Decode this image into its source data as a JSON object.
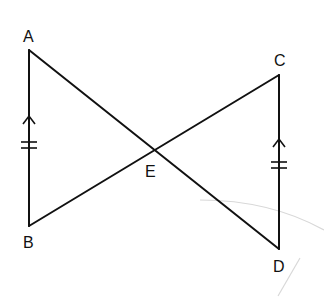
{
  "figure": {
    "type": "geometry",
    "points": {
      "A": {
        "label": "A",
        "x": 29,
        "y": 50
      },
      "B": {
        "label": "B",
        "x": 29,
        "y": 226
      },
      "C": {
        "label": "C",
        "x": 279,
        "y": 75
      },
      "D": {
        "label": "D",
        "x": 279,
        "y": 249
      },
      "E": {
        "label": "E",
        "x": 154,
        "y": 150
      }
    },
    "segments": [
      {
        "from": "A",
        "to": "B",
        "marks": "parallel-arrow + double-tick"
      },
      {
        "from": "C",
        "to": "D",
        "marks": "parallel-arrow + double-tick"
      },
      {
        "from": "A",
        "to": "D",
        "passes_through": "E"
      },
      {
        "from": "B",
        "to": "C",
        "passes_through": "E"
      }
    ],
    "colors": {
      "line": "#111111",
      "background": "#ffffff"
    }
  }
}
